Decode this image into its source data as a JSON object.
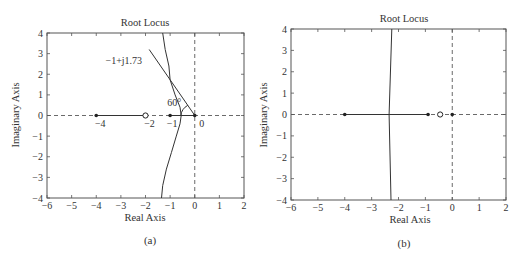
{
  "chart_data": [
    {
      "type": "line",
      "panel": "a",
      "title": "Root Locus",
      "xlabel": "Real Axis",
      "ylabel": "Imaginary Axis",
      "caption": "(a)",
      "xlim": [
        -6,
        2
      ],
      "ylim": [
        -4,
        4
      ],
      "xticks": [
        -6,
        -5,
        -4,
        -3,
        -2,
        -1,
        0,
        1,
        2
      ],
      "yticks": [
        -4,
        -3,
        -2,
        -1,
        0,
        1,
        2,
        3,
        4
      ],
      "grid": false,
      "poles": [
        [
          -4,
          0
        ],
        [
          0,
          0
        ],
        [
          -1,
          0
        ]
      ],
      "zeros": [
        [
          -2,
          0
        ]
      ],
      "real_axis_segments": [
        [
          -4,
          -2
        ],
        [
          -1,
          0
        ]
      ],
      "series": [
        {
          "name": "upper-branch",
          "style": "solid",
          "points": [
            [
              -1.3,
              4
            ],
            [
              -1.2,
              3.2
            ],
            [
              -1.05,
              2.4
            ],
            [
              -1.0,
              1.73
            ],
            [
              -0.8,
              1.0
            ],
            [
              -0.6,
              0.4
            ],
            [
              -0.55,
              0
            ]
          ]
        },
        {
          "name": "lower-branch",
          "style": "solid",
          "points": [
            [
              -0.55,
              0
            ],
            [
              -0.6,
              -0.4
            ],
            [
              -0.75,
              -1.0
            ],
            [
              -0.95,
              -1.8
            ],
            [
              -1.15,
              -2.6
            ],
            [
              -1.3,
              -3.4
            ],
            [
              -1.35,
              -4
            ]
          ]
        },
        {
          "name": "damping-line-60deg",
          "style": "solid",
          "points": [
            [
              -1.85,
              3.2
            ],
            [
              0,
              0
            ]
          ]
        }
      ],
      "annotations": [
        {
          "text": "−1+j1.73",
          "at": [
            -1.0,
            1.73
          ]
        },
        {
          "text": "60°",
          "at": [
            -0.3,
            0.15
          ]
        },
        {
          "text": "−4",
          "at": [
            -4,
            0
          ]
        },
        {
          "text": "−2",
          "at": [
            -2,
            0
          ]
        },
        {
          "text": "−1",
          "at": [
            -1,
            0
          ]
        },
        {
          "text": "0",
          "at": [
            0,
            0
          ]
        }
      ]
    },
    {
      "type": "line",
      "panel": "b",
      "title": "Root Locus",
      "xlabel": "Real Axis",
      "ylabel": "Imaginary Axis",
      "caption": "(b)",
      "xlim": [
        -6,
        2
      ],
      "ylim": [
        -4,
        4
      ],
      "xticks": [
        -6,
        -5,
        -4,
        -3,
        -2,
        -1,
        0,
        1,
        2
      ],
      "yticks": [
        -4,
        -3,
        -2,
        -1,
        0,
        1,
        2,
        3,
        4
      ],
      "grid": false,
      "poles": [
        [
          -4,
          0
        ],
        [
          -0.9,
          0
        ],
        [
          0,
          0
        ]
      ],
      "zeros": [
        [
          -0.45,
          0
        ]
      ],
      "real_axis_segments": [
        [
          -4,
          -0.9
        ]
      ],
      "series": [
        {
          "name": "vertical-branch",
          "style": "solid",
          "points": [
            [
              -2.25,
              4
            ],
            [
              -2.35,
              0
            ],
            [
              -2.28,
              -4
            ]
          ]
        }
      ],
      "annotations": []
    }
  ]
}
